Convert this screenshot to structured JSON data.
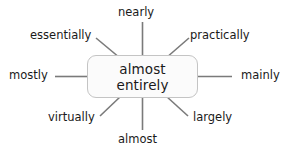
{
  "diagram": {
    "type": "radial-mind-map",
    "background_color": "#ffffff",
    "spoke_color": "#7a7a7a",
    "node_border_color": "#c4c4c4",
    "node_fill_color": "#fbfbfb",
    "text_color": "#1a1a1a",
    "center": {
      "line1": "almost",
      "line2": "entirely"
    },
    "leaves": [
      {
        "id": "nearly",
        "label": "nearly",
        "position": "top"
      },
      {
        "id": "practically",
        "label": "practically",
        "position": "top-right"
      },
      {
        "id": "mainly",
        "label": "mainly",
        "position": "right"
      },
      {
        "id": "largely",
        "label": "largely",
        "position": "bottom-right"
      },
      {
        "id": "almost",
        "label": "almost",
        "position": "bottom"
      },
      {
        "id": "virtually",
        "label": "virtually",
        "position": "bottom-left"
      },
      {
        "id": "mostly",
        "label": "mostly",
        "position": "left"
      },
      {
        "id": "essentially",
        "label": "essentially",
        "position": "top-left"
      }
    ]
  }
}
